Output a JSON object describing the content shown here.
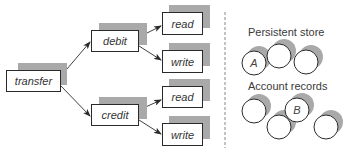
{
  "diagram": {
    "nodes": {
      "transfer": {
        "label": "transfer",
        "x": 6,
        "y": 70,
        "w": 55,
        "h": 22
      },
      "debit": {
        "label": "debit",
        "x": 91,
        "y": 30,
        "w": 48,
        "h": 22
      },
      "credit": {
        "label": "credit",
        "x": 91,
        "y": 104,
        "w": 48,
        "h": 22
      },
      "debit_read": {
        "label": "read",
        "x": 162,
        "y": 12,
        "w": 41,
        "h": 23
      },
      "debit_write": {
        "label": "write",
        "x": 162,
        "y": 50,
        "w": 41,
        "h": 23
      },
      "credit_read": {
        "label": "read",
        "x": 162,
        "y": 86,
        "w": 41,
        "h": 22
      },
      "credit_write": {
        "label": "write",
        "x": 162,
        "y": 123,
        "w": 41,
        "h": 23
      }
    },
    "edges": [
      {
        "from": "transfer",
        "to": "debit"
      },
      {
        "from": "transfer",
        "to": "credit"
      },
      {
        "from": "debit",
        "to": "read"
      },
      {
        "from": "debit",
        "to": "write"
      },
      {
        "from": "credit",
        "to": "read"
      },
      {
        "from": "credit",
        "to": "write"
      }
    ],
    "divider": "dashed-vertical",
    "persistent_store": {
      "title": "Persistent store",
      "circles": [
        {
          "label": "A",
          "cx": 254,
          "cy": 63
        },
        {
          "label": "",
          "cx": 279,
          "cy": 56
        },
        {
          "label": "",
          "cx": 306,
          "cy": 62
        }
      ]
    },
    "account_records": {
      "title": "Account records",
      "circles": [
        {
          "label": "",
          "cx": 254,
          "cy": 111
        },
        {
          "label": "",
          "cx": 279,
          "cy": 127
        },
        {
          "label": "B",
          "cx": 297,
          "cy": 110
        },
        {
          "label": "",
          "cx": 326,
          "cy": 127
        }
      ]
    },
    "colors": {
      "stroke": "#2a2a2a",
      "shadow": "#a9a9a9",
      "text": "#333333",
      "background": "#ffffff"
    }
  }
}
